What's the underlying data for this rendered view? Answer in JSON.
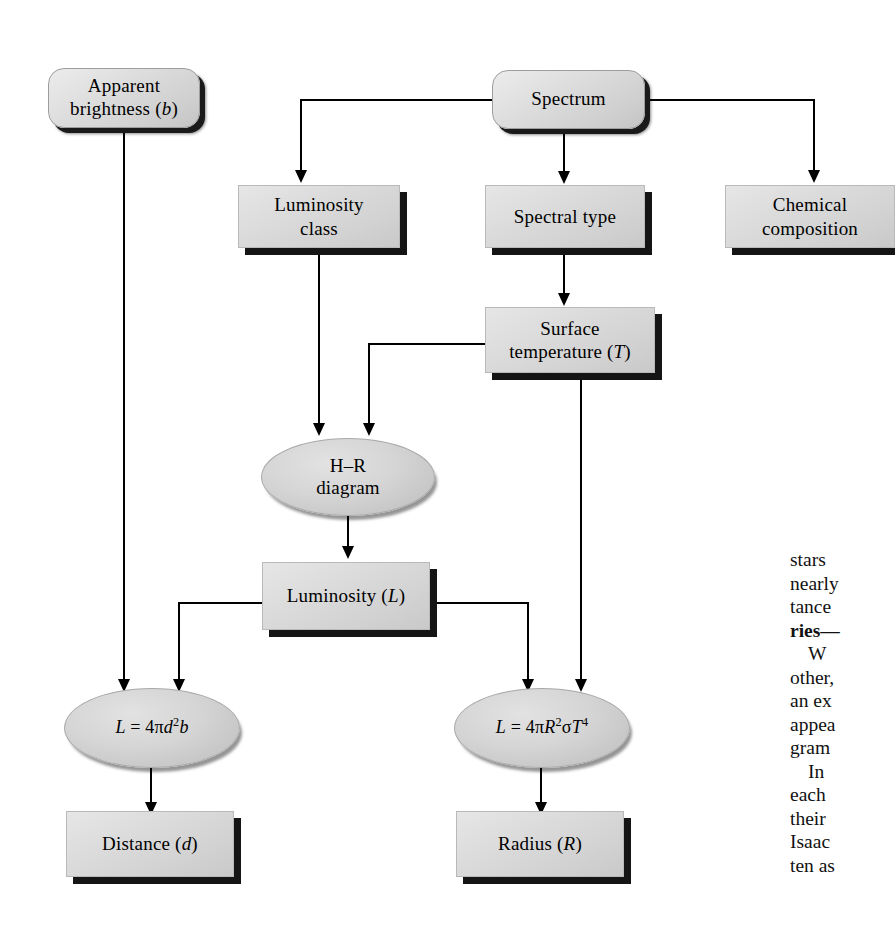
{
  "diagram": {
    "colors": {
      "box_fill": "#d8d8d8",
      "box_shadow": "#151515",
      "ellipse_fill": "#cccccc",
      "line": "#000000",
      "background": "#ffffff"
    },
    "nodes": [
      {
        "id": "apparent-brightness",
        "shape": "rounded-box",
        "label_line1": "Apparent",
        "label_line2": "brightness (b)"
      },
      {
        "id": "spectrum",
        "shape": "rounded-box",
        "label_line1": "Spectrum",
        "label_line2": ""
      },
      {
        "id": "luminosity-class",
        "shape": "box",
        "label_line1": "Luminosity",
        "label_line2": "class"
      },
      {
        "id": "spectral-type",
        "shape": "box",
        "label_line1": "Spectral type",
        "label_line2": ""
      },
      {
        "id": "chemical-composition",
        "shape": "box",
        "label_line1": "Chemical",
        "label_line2": "composition"
      },
      {
        "id": "surface-temperature",
        "shape": "box",
        "label_line1": "Surface",
        "label_line2": "temperature (T)"
      },
      {
        "id": "hr-diagram",
        "shape": "ellipse",
        "label_line1": "H–R",
        "label_line2": "diagram"
      },
      {
        "id": "luminosity",
        "shape": "box",
        "label_line1": "Luminosity (L)",
        "label_line2": ""
      },
      {
        "id": "equation-distance",
        "shape": "ellipse",
        "label_line1": "L = 4πd²b",
        "label_line2": ""
      },
      {
        "id": "equation-radius",
        "shape": "ellipse",
        "label_line1": "L = 4πR²σT⁴",
        "label_line2": ""
      },
      {
        "id": "distance",
        "shape": "box",
        "label_line1": "Distance (d)",
        "label_line2": ""
      },
      {
        "id": "radius",
        "shape": "box",
        "label_line1": "Radius (R)",
        "label_line2": ""
      }
    ],
    "edges": [
      {
        "from": "spectrum",
        "to": "luminosity-class"
      },
      {
        "from": "spectrum",
        "to": "spectral-type"
      },
      {
        "from": "spectrum",
        "to": "chemical-composition"
      },
      {
        "from": "spectral-type",
        "to": "surface-temperature"
      },
      {
        "from": "luminosity-class",
        "to": "hr-diagram"
      },
      {
        "from": "surface-temperature",
        "to": "hr-diagram"
      },
      {
        "from": "surface-temperature",
        "to": "equation-radius"
      },
      {
        "from": "hr-diagram",
        "to": "luminosity"
      },
      {
        "from": "luminosity",
        "to": "equation-distance"
      },
      {
        "from": "luminosity",
        "to": "equation-radius"
      },
      {
        "from": "apparent-brightness",
        "to": "equation-distance"
      },
      {
        "from": "equation-distance",
        "to": "distance"
      },
      {
        "from": "equation-radius",
        "to": "radius"
      }
    ]
  },
  "labels": {
    "apparent_brightness_l1": "Apparent",
    "apparent_brightness_l2_pre": "brightness (",
    "apparent_brightness_l2_var": "b",
    "apparent_brightness_l2_post": ")",
    "spectrum": "Spectrum",
    "luminosity_class_l1": "Luminosity",
    "luminosity_class_l2": "class",
    "spectral_type": "Spectral type",
    "chemical_l1": "Chemical",
    "chemical_l2": "composition",
    "surface_temp_l1": "Surface",
    "surface_temp_l2_pre": "temperature (",
    "surface_temp_l2_var": "T",
    "surface_temp_l2_post": ")",
    "hr_l1": "H–R",
    "hr_l2": "diagram",
    "luminosity_pre": "Luminosity (",
    "luminosity_var": "L",
    "luminosity_post": ")",
    "eq_distance_lhs": "L",
    "eq_distance_eq": " = 4π",
    "eq_distance_d": "d",
    "eq_distance_sup": "2",
    "eq_distance_b": "b",
    "eq_radius_lhs": "L",
    "eq_radius_eq": " = 4π",
    "eq_radius_R": "R",
    "eq_radius_sup1": "2",
    "eq_radius_sigma": "σ",
    "eq_radius_T": "T",
    "eq_radius_sup2": "4",
    "distance_pre": "Distance (",
    "distance_var": "d",
    "distance_post": ")",
    "radius_pre": "Radius (",
    "radius_var": "R",
    "radius_post": ")"
  },
  "body_text": {
    "line01": "stars",
    "line02": "nearly",
    "line03": "tance",
    "line04_bold": "ries—",
    "line05": "W",
    "line06": "other,",
    "line07": "an ex",
    "line08": "appea",
    "line09": "gram",
    "line10": "In",
    "line11": "each",
    "line12": "their",
    "line13": "Isaac",
    "line14": "ten as"
  }
}
